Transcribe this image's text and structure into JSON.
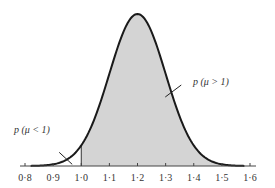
{
  "chart_data": {
    "type": "area",
    "title": "",
    "xlabel": "",
    "ylabel": "",
    "xlim": [
      0.8,
      1.6
    ],
    "x_ticks": [
      "0·8",
      "0·9",
      "1·0",
      "1·1",
      "1·2",
      "1·3",
      "1·4",
      "1·5",
      "1·6"
    ],
    "x_tick_values": [
      0.8,
      0.9,
      1.0,
      1.1,
      1.2,
      1.3,
      1.4,
      1.5,
      1.6
    ],
    "distribution": {
      "kind": "normal",
      "mean": 1.2,
      "sd": 0.1
    },
    "curve_range": [
      0.82,
      1.58
    ],
    "shaded_from": 1.0,
    "shade_color": "#d4d4d4",
    "curve_color": "#1a1a1a",
    "grid": false,
    "annotations": [
      {
        "text": "p (μ < 1)",
        "points_to_x": 0.95
      },
      {
        "text": "p (μ > 1)",
        "points_to_x": 1.32
      }
    ]
  }
}
